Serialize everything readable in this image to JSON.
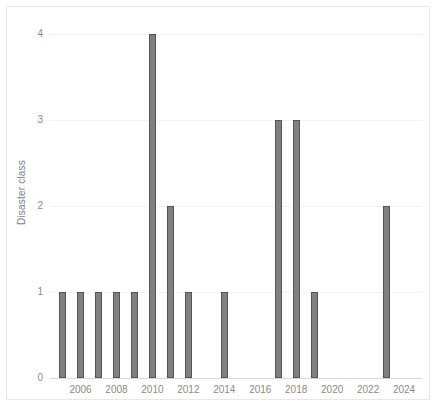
{
  "chart_data": {
    "type": "bar",
    "title": "",
    "subtitle": "",
    "xlabel": "",
    "ylabel": "Disaster class",
    "x": [
      2005,
      2006,
      2007,
      2008,
      2009,
      2010,
      2011,
      2012,
      2014,
      2017,
      2018,
      2019,
      2023
    ],
    "values": [
      1,
      1,
      1,
      1,
      1,
      4,
      2,
      1,
      1,
      3,
      3,
      1,
      2
    ],
    "categories": [
      "2005",
      "2006",
      "2007",
      "2008",
      "2009",
      "2010",
      "2011",
      "2012",
      "2014",
      "2017",
      "2018",
      "2019",
      "2023"
    ],
    "series": [
      {
        "name": "Disaster class",
        "points": [
          {
            "x": 2005,
            "y": 1
          },
          {
            "x": 2006,
            "y": 1
          },
          {
            "x": 2007,
            "y": 1
          },
          {
            "x": 2008,
            "y": 1
          },
          {
            "x": 2009,
            "y": 1
          },
          {
            "x": 2010,
            "y": 4
          },
          {
            "x": 2011,
            "y": 2
          },
          {
            "x": 2012,
            "y": 1
          },
          {
            "x": 2014,
            "y": 1
          },
          {
            "x": 2017,
            "y": 3
          },
          {
            "x": 2018,
            "y": 3
          },
          {
            "x": 2019,
            "y": 1
          },
          {
            "x": 2023,
            "y": 2
          }
        ]
      }
    ],
    "missing_x": [
      2013,
      2015,
      2016,
      2020,
      2021,
      2022,
      2024
    ],
    "xlim": [
      2004.3,
      2025.0
    ],
    "ylim": [
      0,
      4.2
    ],
    "y_ticks": [
      0,
      1,
      2,
      3,
      4
    ],
    "y_tick_labels": [
      "0",
      "1",
      "2",
      "3",
      "4"
    ],
    "x_ticks": [
      2006,
      2008,
      2010,
      2012,
      2014,
      2016,
      2018,
      2020,
      2022,
      2024
    ],
    "x_tick_labels": [
      "2006",
      "2008",
      "2010",
      "2012",
      "2014",
      "2016",
      "2018",
      "2020",
      "2022",
      "2024"
    ],
    "grid": true,
    "grid_axis": "y",
    "legend": false,
    "legend_position": "none",
    "bar_color": "#808080",
    "bar_edge_color": "#555555",
    "grid_color": "#f2f2f2",
    "axis_color": "#d8d8d8",
    "tick_label_color": "#8a8a8a",
    "axis_title_color": "#7d7d7d",
    "background_color": "#ffffff",
    "frame_color": "#e8e8e8"
  }
}
